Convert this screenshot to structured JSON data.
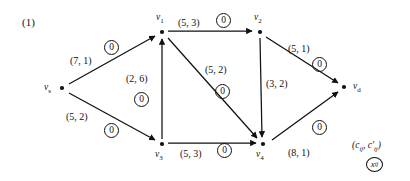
{
  "figure": {
    "index_label": "(1)"
  },
  "nodes": [
    {
      "id": "vs",
      "label": "v",
      "sub": "s",
      "x": 62,
      "y": 88,
      "label_x": 44,
      "label_y": 82
    },
    {
      "id": "v1",
      "label": "v",
      "sub": "1",
      "x": 162,
      "y": 32,
      "label_x": 156,
      "label_y": 12
    },
    {
      "id": "v2",
      "label": "v",
      "sub": "2",
      "x": 260,
      "y": 32,
      "label_x": 254,
      "label_y": 12
    },
    {
      "id": "v3",
      "label": "v",
      "sub": "3",
      "x": 162,
      "y": 144,
      "label_x": 155,
      "label_y": 149
    },
    {
      "id": "v4",
      "label": "v",
      "sub": "4",
      "x": 263,
      "y": 144,
      "label_x": 256,
      "label_y": 149
    },
    {
      "id": "vd",
      "label": "v",
      "sub": "d",
      "x": 344,
      "y": 87,
      "label_x": 353,
      "label_y": 81
    }
  ],
  "edges": [
    {
      "from": "vs",
      "to": "v1",
      "capacity": "(7, 1)",
      "flow": "0",
      "cap_x": 70,
      "cap_y": 55,
      "flow_x": 104,
      "flow_y": 40
    },
    {
      "from": "vs",
      "to": "v3",
      "capacity": "(5, 2)",
      "flow": "0",
      "cap_x": 66,
      "cap_y": 111,
      "flow_x": 104,
      "flow_y": 123
    },
    {
      "from": "v3",
      "to": "v1",
      "capacity": "(2, 6)",
      "flow": "0",
      "cap_x": 126,
      "cap_y": 73,
      "flow_x": 134,
      "flow_y": 92
    },
    {
      "from": "v1",
      "to": "v2",
      "capacity": "(5, 3)",
      "flow": "0",
      "cap_x": 178,
      "cap_y": 17,
      "flow_x": 216,
      "flow_y": 13
    },
    {
      "from": "v1",
      "to": "v4",
      "capacity": "(5, 2)",
      "flow": "0",
      "cap_x": 205,
      "cap_y": 64,
      "flow_x": 215,
      "flow_y": 84
    },
    {
      "from": "v2",
      "to": "v4",
      "capacity": "(3, 2)",
      "flow": "",
      "cap_x": 266,
      "cap_y": 78,
      "flow_x": null,
      "flow_y": null
    },
    {
      "from": "v2",
      "to": "vd",
      "capacity": "(5, 1)",
      "flow": "0",
      "cap_x": 288,
      "cap_y": 43,
      "flow_x": 312,
      "flow_y": 57
    },
    {
      "from": "v3",
      "to": "v4",
      "capacity": "(5, 3)",
      "flow": "0",
      "cap_x": 180,
      "cap_y": 148,
      "flow_x": 217,
      "flow_y": 143
    },
    {
      "from": "v4",
      "to": "vd",
      "capacity": "(8, 1)",
      "flow": "0",
      "cap_x": 288,
      "cap_y": 147,
      "flow_x": 312,
      "flow_y": 120
    }
  ],
  "legend": {
    "capacity_notation": "(c",
    "capacity_sub1": "ij",
    "capacity_mid": ", c",
    "capacity_sub2": "ij",
    "capacity_end": ")",
    "capacity_full": "(cij, c'ij)",
    "flow_symbol": "x",
    "flow_sub": "ij",
    "x": 352,
    "y": 140
  },
  "colors": {
    "stroke": "#111111",
    "background": "#ffffff"
  }
}
